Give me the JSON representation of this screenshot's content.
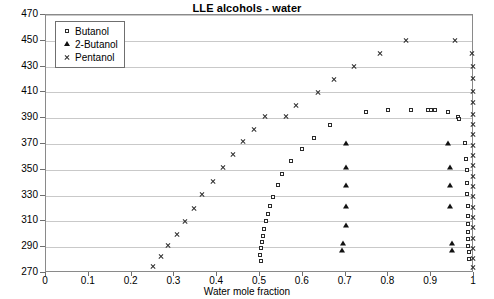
{
  "chart_data": {
    "type": "scatter",
    "title": "LLE alcohols - water",
    "xlabel": "Water mole fraction",
    "ylabel": "T/K",
    "xlim": [
      0,
      1
    ],
    "ylim": [
      270,
      470
    ],
    "xticks": [
      "0",
      "0.1",
      "0.2",
      "0.3",
      "0.4",
      "0.5",
      "0.6",
      "0.7",
      "0.8",
      "0.9",
      "1"
    ],
    "xtick_values": [
      0,
      0.1,
      0.2,
      0.3,
      0.4,
      0.5,
      0.6,
      0.7,
      0.8,
      0.9,
      1
    ],
    "yticks": [
      "270",
      "290",
      "310",
      "330",
      "350",
      "370",
      "390",
      "410",
      "430",
      "450",
      "470"
    ],
    "ytick_values": [
      270,
      290,
      310,
      330,
      350,
      370,
      390,
      410,
      430,
      450,
      470
    ],
    "grid": "horizontal",
    "legend_position": "top-left",
    "series": [
      {
        "name": "Butanol",
        "marker": "open-square",
        "color": "#2b2b2b",
        "points": [
          [
            0.503,
            279
          ],
          [
            0.5,
            284
          ],
          [
            0.503,
            289
          ],
          [
            0.505,
            294
          ],
          [
            0.508,
            299
          ],
          [
            0.51,
            304
          ],
          [
            0.513,
            310
          ],
          [
            0.518,
            316
          ],
          [
            0.523,
            322
          ],
          [
            0.53,
            329
          ],
          [
            0.542,
            338
          ],
          [
            0.552,
            347
          ],
          [
            0.573,
            357
          ],
          [
            0.597,
            366
          ],
          [
            0.625,
            375
          ],
          [
            0.663,
            385
          ],
          [
            0.748,
            395
          ],
          [
            0.8,
            396
          ],
          [
            0.852,
            396
          ],
          [
            0.893,
            396
          ],
          [
            0.9,
            396
          ],
          [
            0.91,
            396
          ],
          [
            0.94,
            395
          ],
          [
            0.963,
            391
          ],
          [
            0.965,
            389
          ],
          [
            0.98,
            371
          ],
          [
            0.982,
            358
          ],
          [
            0.983,
            350
          ],
          [
            0.983,
            340
          ],
          [
            0.984,
            331
          ],
          [
            0.985,
            322
          ],
          [
            0.985,
            314
          ],
          [
            0.986,
            308
          ],
          [
            0.986,
            302
          ],
          [
            0.987,
            296
          ],
          [
            0.987,
            291
          ],
          [
            0.988,
            286
          ],
          [
            0.988,
            281
          ]
        ]
      },
      {
        "name": "2-Butanol",
        "marker": "filled-triangle",
        "color": "#111111",
        "points": [
          [
            0.692,
            288
          ],
          [
            0.693,
            293
          ],
          [
            0.7,
            307
          ],
          [
            0.7,
            322
          ],
          [
            0.7,
            338
          ],
          [
            0.702,
            352
          ],
          [
            0.7,
            371
          ],
          [
            0.94,
            371
          ],
          [
            0.943,
            352
          ],
          [
            0.945,
            338
          ],
          [
            0.945,
            322
          ],
          [
            0.948,
            293
          ],
          [
            0.948,
            288
          ]
        ]
      },
      {
        "name": "Pentanol",
        "marker": "cross",
        "color": "#2b2b2b",
        "points": [
          [
            0.25,
            275
          ],
          [
            0.268,
            283
          ],
          [
            0.285,
            291
          ],
          [
            0.305,
            300
          ],
          [
            0.325,
            310
          ],
          [
            0.345,
            320
          ],
          [
            0.365,
            331
          ],
          [
            0.39,
            341
          ],
          [
            0.413,
            352
          ],
          [
            0.437,
            362
          ],
          [
            0.46,
            372
          ],
          [
            0.487,
            381
          ],
          [
            0.512,
            391
          ],
          [
            0.56,
            391
          ],
          [
            0.585,
            400
          ],
          [
            0.635,
            410
          ],
          [
            0.672,
            420
          ],
          [
            0.72,
            430
          ],
          [
            0.78,
            440
          ],
          [
            0.84,
            450
          ],
          [
            0.955,
            450
          ],
          [
            0.995,
            440
          ],
          [
            0.997,
            430
          ],
          [
            0.997,
            421
          ],
          [
            0.998,
            411
          ],
          [
            0.998,
            402
          ],
          [
            0.998,
            393
          ],
          [
            0.998,
            385
          ],
          [
            0.998,
            377
          ],
          [
            0.998,
            369
          ],
          [
            0.998,
            361
          ],
          [
            0.998,
            353
          ],
          [
            0.998,
            345
          ],
          [
            0.998,
            337
          ],
          [
            0.998,
            329
          ],
          [
            0.998,
            321
          ],
          [
            0.998,
            313
          ],
          [
            0.998,
            305
          ],
          [
            0.998,
            297
          ],
          [
            0.998,
            289
          ],
          [
            0.998,
            281
          ],
          [
            0.998,
            274
          ]
        ]
      }
    ]
  },
  "legend": {
    "items": [
      {
        "label": "Butanol",
        "glyph": "open-square"
      },
      {
        "label": "2-Butanol",
        "glyph": "filled-triangle"
      },
      {
        "label": "Pentanol",
        "glyph": "cross"
      }
    ]
  }
}
